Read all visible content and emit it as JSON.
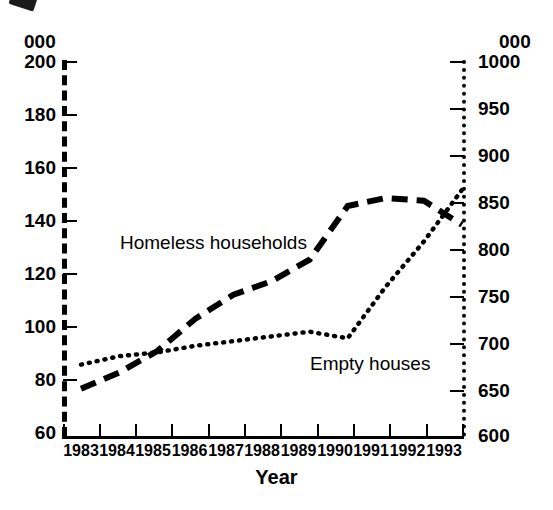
{
  "chart_data": {
    "type": "line",
    "title": "",
    "xlabel": "Year",
    "grid": false,
    "legend_position": "inline-annotations",
    "x": [
      "1983",
      "1984",
      "1985",
      "1986",
      "1987",
      "1988",
      "1989",
      "1990",
      "1991",
      "1992",
      "1993"
    ],
    "axes": {
      "left": {
        "unit": "000",
        "ticks": [
          "200",
          "180",
          "160",
          "140",
          "120",
          "100",
          "80",
          "60"
        ],
        "tick_values": [
          200,
          180,
          160,
          140,
          120,
          100,
          80,
          60
        ],
        "ylim": [
          60,
          200
        ],
        "series": "Homeless households"
      },
      "right": {
        "unit": "000",
        "ticks": [
          "1000",
          "950",
          "900",
          "850",
          "800",
          "750",
          "700",
          "650",
          "600"
        ],
        "tick_values": [
          1000,
          950,
          900,
          850,
          800,
          750,
          700,
          650,
          600
        ],
        "ylim": [
          600,
          1000
        ],
        "series": "Empty houses"
      }
    },
    "series": [
      {
        "name": "Homeless households",
        "axis": "left",
        "style": "dashed",
        "values": [
          78,
          84,
          92,
          104,
          113,
          118,
          126,
          146,
          149,
          148,
          139
        ]
      },
      {
        "name": "Empty houses",
        "axis": "right",
        "style": "dotted",
        "values": [
          677,
          686,
          690,
          697,
          702,
          707,
          712,
          705,
          760,
          808,
          863
        ]
      }
    ],
    "annotations": [
      {
        "text": "Homeless households",
        "x_px": 120,
        "y_px": 248
      },
      {
        "text": "Empty houses",
        "x_px": 310,
        "y_px": 369
      }
    ]
  }
}
